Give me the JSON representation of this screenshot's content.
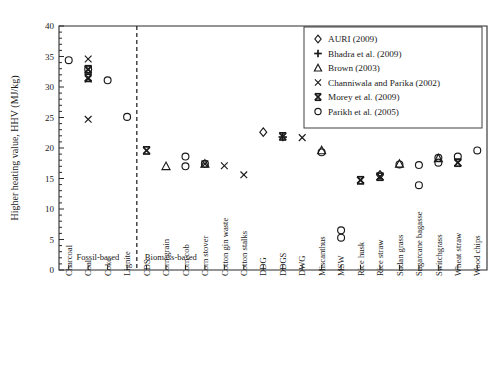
{
  "chart_data": {
    "type": "scatter",
    "title": "",
    "xlabel": "",
    "ylabel": "Higher heating value, HHV (MJ/kg)",
    "ylim": [
      0,
      40
    ],
    "ytick_step": 5,
    "yticks": [
      "0",
      "5",
      "10",
      "15",
      "20",
      "25",
      "30",
      "35",
      "40"
    ],
    "grid": false,
    "legend_position": "top-right",
    "categories": [
      "Charcoal",
      "Coal",
      "Coke",
      "Lignite",
      "CDS",
      "Corn grain",
      "Corn cob",
      "Corn stover",
      "Cotton gin waste",
      "Cotton stalks",
      "DDG",
      "DDGS",
      "DWG",
      "Miscanthus",
      "MSW",
      "Rice husk",
      "Rice straw",
      "Sudan grass",
      "Sugarcane bagasse",
      "Switchgrass",
      "Wheat straw",
      "Wood chips"
    ],
    "group_annotations": [
      {
        "label": "Fossil-based",
        "from": "Charcoal",
        "to": "Lignite"
      },
      {
        "label": "Biomass-based",
        "from": "CDS",
        "to": "Wood chips"
      }
    ],
    "divider_between": [
      "Lignite",
      "CDS"
    ],
    "series": [
      {
        "name": "AURI (2009)",
        "marker": "diamond",
        "points": [
          {
            "category": "DDG",
            "value": 22.6
          },
          {
            "category": "Rice straw",
            "value": 15.6
          }
        ]
      },
      {
        "name": "Bhadra et al. (2009)",
        "marker": "plus",
        "points": [
          {
            "category": "DDGS",
            "value": 21.8
          }
        ]
      },
      {
        "name": "Brown (2003)",
        "marker": "triangle",
        "points": [
          {
            "category": "Corn grain",
            "value": 17.0
          },
          {
            "category": "Corn stover",
            "value": 17.4
          },
          {
            "category": "Miscanthus",
            "value": 19.6
          },
          {
            "category": "Sudan grass",
            "value": 17.4
          },
          {
            "category": "Switchgrass",
            "value": 18.3
          }
        ]
      },
      {
        "name": "Channiwala and Parika (2002)",
        "marker": "x",
        "points": [
          {
            "category": "Coal",
            "value": 34.6
          },
          {
            "category": "Coal",
            "value": 32.8
          },
          {
            "category": "Coal",
            "value": 31.3
          },
          {
            "category": "Coal",
            "value": 24.7
          },
          {
            "category": "Corn stover",
            "value": 17.4
          },
          {
            "category": "Cotton gin waste",
            "value": 17.1
          },
          {
            "category": "Cotton stalks",
            "value": 15.6
          },
          {
            "category": "DWG",
            "value": 21.7
          },
          {
            "category": "Rice husk",
            "value": 14.8
          },
          {
            "category": "Rice straw",
            "value": 15.3
          },
          {
            "category": "Wheat straw",
            "value": 17.6
          }
        ]
      },
      {
        "name": "Morey et al. (2009)",
        "marker": "x-bar",
        "points": [
          {
            "category": "Coal",
            "value": 32.9
          },
          {
            "category": "Coal",
            "value": 31.5
          },
          {
            "category": "CDS",
            "value": 19.6
          },
          {
            "category": "DDGS",
            "value": 21.9
          },
          {
            "category": "Rice husk",
            "value": 14.7
          },
          {
            "category": "Rice straw",
            "value": 15.3
          },
          {
            "category": "Wheat straw",
            "value": 17.6
          }
        ]
      },
      {
        "name": "Parikh et al. (2005)",
        "marker": "circle",
        "points": [
          {
            "category": "Charcoal",
            "value": 34.4
          },
          {
            "category": "Coal",
            "value": 32.9
          },
          {
            "category": "Coke",
            "value": 31.1
          },
          {
            "category": "Lignite",
            "value": 25.1
          },
          {
            "category": "Corn cob",
            "value": 18.6
          },
          {
            "category": "Corn cob",
            "value": 17.0
          },
          {
            "category": "Corn stover",
            "value": 17.4
          },
          {
            "category": "Miscanthus",
            "value": 19.3
          },
          {
            "category": "MSW",
            "value": 6.5
          },
          {
            "category": "MSW",
            "value": 5.3
          },
          {
            "category": "Sudan grass",
            "value": 17.3
          },
          {
            "category": "Sugarcane bagasse",
            "value": 17.2
          },
          {
            "category": "Sugarcane bagasse",
            "value": 13.9
          },
          {
            "category": "Switchgrass",
            "value": 18.4
          },
          {
            "category": "Switchgrass",
            "value": 17.6
          },
          {
            "category": "Wheat straw",
            "value": 18.6
          },
          {
            "category": "Wood chips",
            "value": 19.6
          }
        ]
      }
    ],
    "legend_entries": [
      {
        "marker": "diamond",
        "label": "AURI (2009)"
      },
      {
        "marker": "plus",
        "label": "Bhadra et al. (2009)"
      },
      {
        "marker": "triangle",
        "label": "Brown (2003)"
      },
      {
        "marker": "x",
        "label": "Channiwala and Parika (2002)"
      },
      {
        "marker": "x-bar",
        "label": "Morey et al. (2009)"
      },
      {
        "marker": "circle",
        "label": "Parikh et al. (2005)"
      }
    ]
  }
}
